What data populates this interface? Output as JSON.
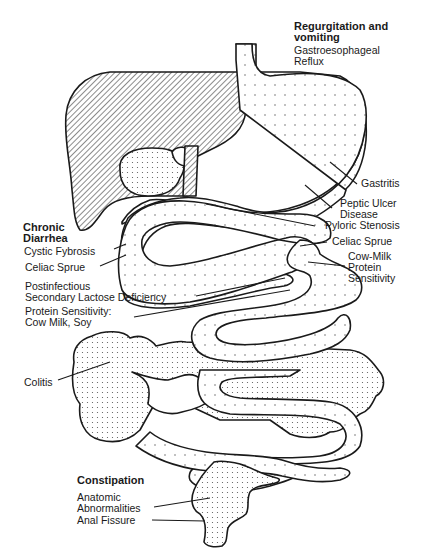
{
  "diagram": {
    "type": "anatomical-illustration",
    "colors": {
      "stroke": "#1a1a1a",
      "background": "#ffffff",
      "hatch": "#1a1a1a",
      "dots": "#555555"
    },
    "groups": {
      "regurgitation": {
        "heading_line1": "Regurgitation and",
        "heading_line2": "vomiting",
        "items": [
          {
            "line1": "Gastroesophageal",
            "line2": "Reflux"
          },
          {
            "line1": "Gastritis"
          },
          {
            "line1": "Peptic Ulcer",
            "line2": "Disease"
          },
          {
            "line1": "Pyloric Stenosis"
          }
        ]
      },
      "chronic_diarrhea": {
        "heading_line1": "Chronic",
        "heading_line2": "Diarrhea",
        "items": [
          {
            "line1": "Cystic Fybrosis"
          },
          {
            "line1": "Celiac Sprue"
          },
          {
            "line1": "Postinfectious",
            "line2": "Secondary Lactose Deficiency"
          },
          {
            "line1": "Protein Sensitivity:",
            "line2": "Cow Milk, Soy"
          },
          {
            "line1": "Colitis"
          }
        ]
      },
      "right_labels": {
        "items": [
          {
            "line1": "Celiac Sprue"
          },
          {
            "line1": "Cow-Milk",
            "line2": "Protein",
            "line3": "Sensitivity"
          }
        ]
      },
      "constipation": {
        "heading": "Constipation",
        "items": [
          {
            "line1": "Anatomic",
            "line2": "Abnormalities"
          },
          {
            "line1": "Anal Fissure"
          }
        ]
      }
    }
  }
}
